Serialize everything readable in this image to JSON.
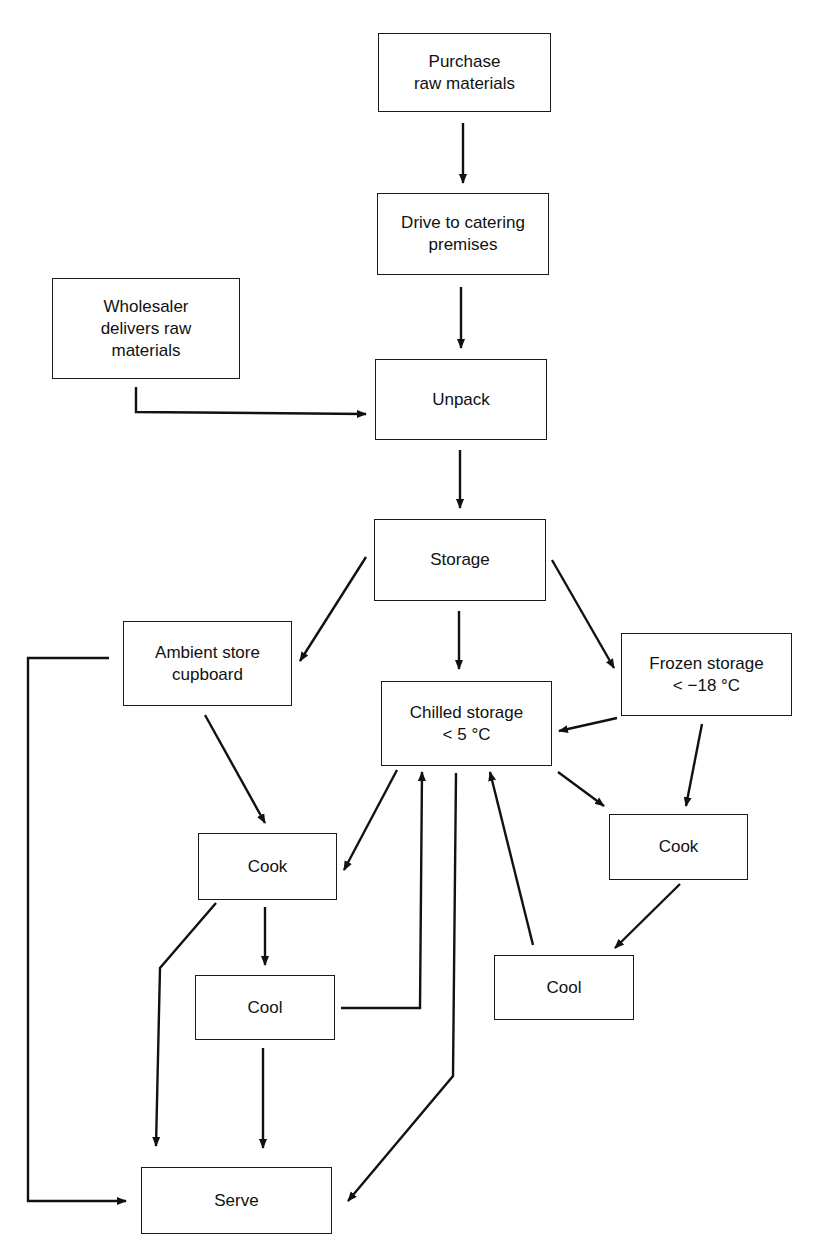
{
  "diagram": {
    "title": "",
    "colors": {
      "line": "#111111",
      "box_border": "#1a1a1a",
      "background": "#ffffff"
    },
    "nodes": [
      {
        "id": "purchase",
        "label": "Purchase\nraw materials",
        "x": 378,
        "y": 33,
        "w": 173,
        "h": 79
      },
      {
        "id": "drive",
        "label": "Drive to catering\npremises",
        "x": 377,
        "y": 193,
        "w": 172,
        "h": 82
      },
      {
        "id": "wholesaler",
        "label": "Wholesaler\ndelivers raw\nmaterials",
        "x": 52,
        "y": 278,
        "w": 188,
        "h": 101
      },
      {
        "id": "unpack",
        "label": "Unpack",
        "x": 375,
        "y": 359,
        "w": 172,
        "h": 81
      },
      {
        "id": "storage",
        "label": "Storage",
        "x": 374,
        "y": 519,
        "w": 172,
        "h": 82
      },
      {
        "id": "ambient",
        "label": "Ambient store\ncupboard",
        "x": 123,
        "y": 621,
        "w": 169,
        "h": 85
      },
      {
        "id": "frozen",
        "label": "Frozen storage\n< −18 °C",
        "x": 621,
        "y": 633,
        "w": 171,
        "h": 83
      },
      {
        "id": "chilled",
        "label": "Chilled storage\n< 5 °C",
        "x": 381,
        "y": 681,
        "w": 171,
        "h": 85
      },
      {
        "id": "cook_left",
        "label": "Cook",
        "x": 198,
        "y": 833,
        "w": 139,
        "h": 67
      },
      {
        "id": "cook_right",
        "label": "Cook",
        "x": 609,
        "y": 814,
        "w": 139,
        "h": 66
      },
      {
        "id": "cool_left",
        "label": "Cool",
        "x": 195,
        "y": 975,
        "w": 140,
        "h": 65
      },
      {
        "id": "cool_right",
        "label": "Cool",
        "x": 494,
        "y": 955,
        "w": 140,
        "h": 65
      },
      {
        "id": "serve",
        "label": "Serve",
        "x": 141,
        "y": 1167,
        "w": 191,
        "h": 67
      }
    ],
    "edges": [
      {
        "from": "purchase",
        "to": "drive",
        "points": [
          [
            463,
            123
          ],
          [
            463,
            183
          ]
        ]
      },
      {
        "from": "drive",
        "to": "unpack",
        "points": [
          [
            461,
            287
          ],
          [
            461,
            348
          ]
        ]
      },
      {
        "from": "wholesaler",
        "to": "unpack",
        "points": [
          [
            136,
            387
          ],
          [
            136,
            412
          ],
          [
            366,
            414
          ]
        ]
      },
      {
        "from": "unpack",
        "to": "storage",
        "points": [
          [
            460,
            450
          ],
          [
            460,
            508
          ]
        ]
      },
      {
        "from": "storage",
        "to": "ambient",
        "points": [
          [
            366,
            557
          ],
          [
            300,
            661
          ]
        ]
      },
      {
        "from": "storage",
        "to": "chilled",
        "points": [
          [
            459,
            611
          ],
          [
            459,
            669
          ]
        ]
      },
      {
        "from": "storage",
        "to": "frozen",
        "points": [
          [
            552,
            560
          ],
          [
            614,
            668
          ]
        ]
      },
      {
        "from": "frozen",
        "to": "chilled",
        "points": [
          [
            617,
            718
          ],
          [
            559,
            731
          ]
        ]
      },
      {
        "from": "frozen",
        "to": "cook_right",
        "points": [
          [
            702,
            724
          ],
          [
            686,
            806
          ]
        ]
      },
      {
        "from": "chilled",
        "to": "cook_right",
        "points": [
          [
            558,
            772
          ],
          [
            604,
            806
          ]
        ]
      },
      {
        "from": "chilled",
        "to": "cook_left",
        "points": [
          [
            397,
            770
          ],
          [
            344,
            870
          ]
        ]
      },
      {
        "from": "ambient",
        "to": "cook_left",
        "points": [
          [
            205,
            715
          ],
          [
            265,
            823
          ]
        ]
      },
      {
        "from": "ambient",
        "to": "serve",
        "points": [
          [
            109,
            658
          ],
          [
            28,
            658
          ],
          [
            28,
            1201
          ],
          [
            126,
            1201
          ]
        ]
      },
      {
        "from": "cook_left",
        "to": "chilled",
        "points": [
          [
            216,
            903
          ],
          [
            160,
            968
          ],
          [
            156,
            1146
          ]
        ]
      },
      {
        "from": "cook_left",
        "to": "cool_left",
        "points": [
          [
            265,
            907
          ],
          [
            265,
            965
          ]
        ]
      },
      {
        "from": "cool_left",
        "to": "chilled",
        "points": [
          [
            341,
            1008
          ],
          [
            420,
            1008
          ],
          [
            422,
            772
          ]
        ]
      },
      {
        "from": "cool_left",
        "to": "serve",
        "points": [
          [
            263,
            1048
          ],
          [
            263,
            1148
          ]
        ]
      },
      {
        "from": "chilled",
        "to": "serve",
        "points": [
          [
            456,
            773
          ],
          [
            453,
            1076
          ],
          [
            348,
            1201
          ]
        ]
      },
      {
        "from": "cook_right",
        "to": "cool_right",
        "points": [
          [
            680,
            884
          ],
          [
            615,
            948
          ]
        ]
      },
      {
        "from": "cool_right",
        "to": "chilled",
        "points": [
          [
            533,
            945
          ],
          [
            490,
            772
          ]
        ]
      }
    ]
  }
}
